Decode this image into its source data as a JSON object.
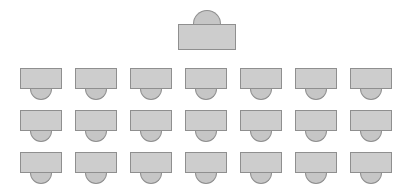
{
  "diagram": {
    "type": "seating-chart",
    "canvas": {
      "width": 414,
      "height": 186,
      "background": "#ffffff"
    },
    "colors": {
      "desk_fill": "#cdcdcd",
      "chair_fill": "#c6c6c6",
      "outline": "#8f8f8f",
      "background": "#ffffff"
    },
    "teacher": {
      "label": "Teacher Desk",
      "desk": {
        "x": 178,
        "y": 24,
        "width": 58,
        "height": 26
      },
      "chair": {
        "cx": 207,
        "y": 10,
        "width": 28,
        "height": 14,
        "orientation": "above-desk"
      }
    },
    "students": {
      "label": "Student Desks",
      "rows": 3,
      "columns": 7,
      "total_seats": 21,
      "desk": {
        "width": 42,
        "height": 21
      },
      "chair": {
        "width": 22,
        "height": 11,
        "orientation": "below-desk"
      },
      "origin_x": 20,
      "column_pitch": 55,
      "row_tops": [
        68,
        110,
        152
      ]
    }
  }
}
